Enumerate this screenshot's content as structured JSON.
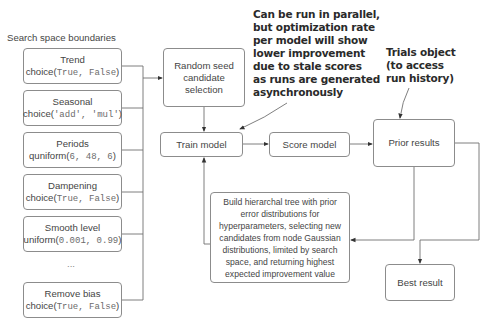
{
  "left_panel": {
    "title": "Search space boundaries",
    "params": [
      {
        "name": "Trend",
        "func": "choice(",
        "args": "True, False",
        "close": ")"
      },
      {
        "name": "Seasonal",
        "func": "choice(",
        "args": "'add', 'mul'",
        "close": ")"
      },
      {
        "name": "Periods",
        "func": "quniform(",
        "args": "6, 48, 6",
        "close": ")"
      },
      {
        "name": "Dampening",
        "func": "choice(",
        "args": "True, False",
        "close": ")"
      },
      {
        "name": "Smooth level",
        "func": "uniform(",
        "args": "0.001, 0.99",
        "close": ")"
      },
      {
        "name": "Remove bias",
        "func": "choice(",
        "args": "True, False",
        "close": ")"
      }
    ],
    "ellipsis": "..."
  },
  "nodes": {
    "random_seed": {
      "line1": "Random seed",
      "line2": "candidate",
      "line3": "selection"
    },
    "train_model": "Train model",
    "score_model": "Score model",
    "prior_results": "Prior results",
    "best_result": "Best result",
    "build_tree": {
      "lines": [
        "Build hierarchal tree with prior",
        "error distributions for",
        "hyperparameters, selecting new",
        "candidates from node Gaussian",
        "distributions, limited by search",
        "space, and returning highest",
        "expected improvement value"
      ]
    }
  },
  "annotations": {
    "parallel": "Can be run in parallel,\nbut optimization rate\nper model will show\nlower improvement\ndue to stale scores\nas runs are generated\nasynchronously",
    "trials": "Trials object\n(to access\nrun history)"
  },
  "colors": {
    "line": "#6e6e6e",
    "border": "#8c8c8c",
    "text": "#454545",
    "annotation": "#2a2a2a"
  }
}
